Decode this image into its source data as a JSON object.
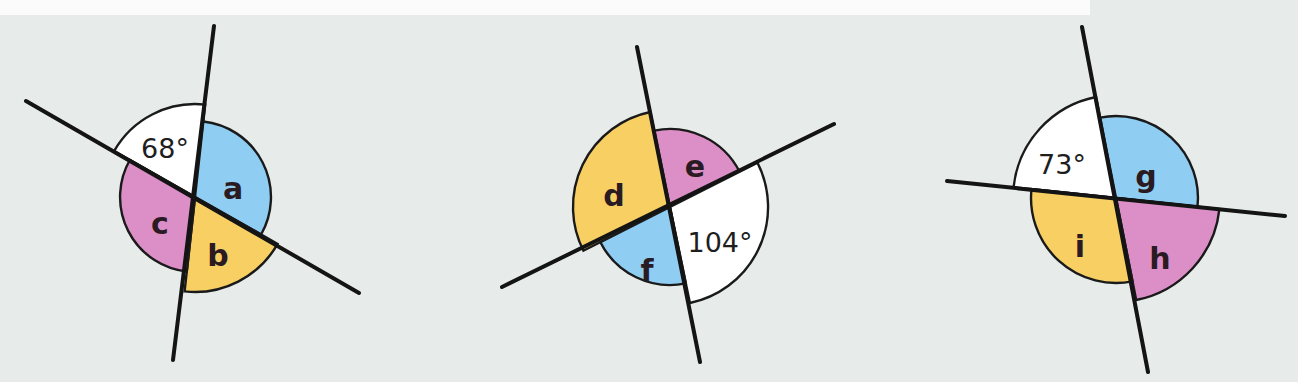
{
  "colors": {
    "background": "#e7ebea",
    "blue": "#8fcdf3",
    "pink": "#dc8fc7",
    "yellow": "#f7cf62",
    "white": "#ffffff",
    "line": "#141414"
  },
  "diagrams": [
    {
      "id": "diagram-1",
      "center": [
        195,
        197
      ],
      "lines": [
        {
          "from": [
            214,
            26
          ],
          "to": [
            173,
            360
          ]
        },
        {
          "from": [
            26,
            101
          ],
          "to": [
            359,
            293
          ]
        }
      ],
      "sectors": [
        {
          "label": "68°",
          "kind": "given-angle",
          "color": "white",
          "start": -150.4,
          "end": -83.7,
          "r": 93,
          "labelPos": [
            165,
            150
          ]
        },
        {
          "label": "a",
          "kind": "unknown-angle",
          "color": "blue",
          "start": -83.7,
          "end": 29.6,
          "r": 76,
          "labelPos": [
            233,
            190
          ]
        },
        {
          "label": "b",
          "kind": "unknown-angle",
          "color": "yellow",
          "start": 29.6,
          "end": 96.3,
          "r": 95,
          "labelPos": [
            218,
            257
          ]
        },
        {
          "label": "c",
          "kind": "unknown-angle",
          "color": "pink",
          "start": 96.3,
          "end": 209.6,
          "r": 75,
          "labelPos": [
            160,
            225
          ]
        }
      ]
    },
    {
      "id": "diagram-2",
      "center": [
        670,
        207
      ],
      "lines": [
        {
          "from": [
            637,
            47
          ],
          "to": [
            700,
            362
          ]
        },
        {
          "from": [
            502,
            287
          ],
          "to": [
            834,
            124
          ]
        }
      ],
      "sectors": [
        {
          "label": "d",
          "kind": "unknown-angle",
          "color": "yellow",
          "start": 153.2,
          "end": 258.3,
          "r": 97,
          "labelPos": [
            614,
            197
          ]
        },
        {
          "label": "e",
          "kind": "unknown-angle",
          "color": "pink",
          "start": -101.7,
          "end": -26.8,
          "r": 78,
          "labelPos": [
            695,
            168
          ]
        },
        {
          "label": "104°",
          "kind": "given-angle",
          "color": "white",
          "start": -26.8,
          "end": 78.3,
          "r": 98,
          "labelPos": [
            720,
            244
          ]
        },
        {
          "label": "f",
          "kind": "unknown-angle",
          "color": "blue",
          "start": 78.3,
          "end": 153.2,
          "r": 78,
          "labelPos": [
            647,
            272
          ]
        }
      ]
    },
    {
      "id": "diagram-3",
      "center": [
        1116,
        198
      ],
      "lines": [
        {
          "from": [
            1082,
            27
          ],
          "to": [
            1148,
            372
          ]
        },
        {
          "from": [
            947,
            181
          ],
          "to": [
            1285,
            216
          ]
        }
      ],
      "sectors": [
        {
          "label": "73°",
          "kind": "given-angle",
          "color": "white",
          "start": 186.1,
          "end": 258.8,
          "r": 103,
          "labelPos": [
            1062,
            166
          ]
        },
        {
          "label": "g",
          "kind": "unknown-angle",
          "color": "blue",
          "start": -101.2,
          "end": 6.1,
          "r": 82,
          "labelPos": [
            1146,
            178
          ]
        },
        {
          "label": "h",
          "kind": "unknown-angle",
          "color": "pink",
          "start": 6.1,
          "end": 78.8,
          "r": 104,
          "labelPos": [
            1160,
            260
          ]
        },
        {
          "label": "i",
          "kind": "unknown-angle",
          "color": "yellow",
          "start": 78.8,
          "end": 186.1,
          "r": 85,
          "labelPos": [
            1080,
            248
          ]
        }
      ]
    }
  ]
}
